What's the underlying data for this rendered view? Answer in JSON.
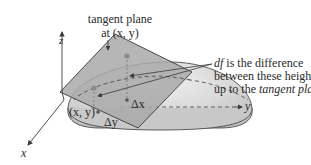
{
  "figure": {
    "title_label_line1": "tangent plane",
    "title_label_line2": "at (x, y)",
    "annotation_line1_italic": "df",
    "annotation_line1_rest": " is the difference",
    "annotation_line2": "between these heights",
    "annotation_line3_plain": "up to the ",
    "annotation_line3_italic": "tangent plane",
    "axis_z": "z",
    "axis_y": "y",
    "axis_x": "x",
    "point_label": "(x, y)",
    "delta_x": "Δx",
    "delta_y": "Δy"
  },
  "colors": {
    "surface_fill": "#d6d6d6",
    "plane_fill": "#a9a9a9",
    "outline": "#3a3a3a",
    "point_marker": "#8a8a8a",
    "text": "#2b2b2b"
  }
}
